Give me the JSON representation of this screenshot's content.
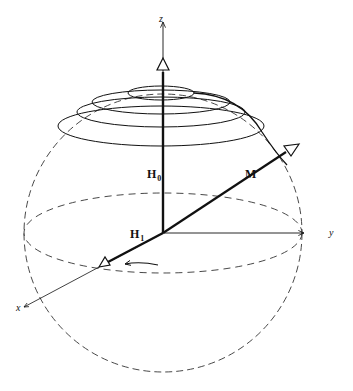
{
  "diagram": {
    "type": "rotating-frame-sphere",
    "axes": {
      "z": "z",
      "y": "y",
      "x": "x"
    },
    "vectors": {
      "H0": {
        "main": "H",
        "sub": "0"
      },
      "H1": {
        "main": "H",
        "sub": "1"
      },
      "M": {
        "main": "M"
      }
    },
    "colors": {
      "stroke": "#111111",
      "sphere_dash": "#333333",
      "background": "#ffffff"
    }
  }
}
